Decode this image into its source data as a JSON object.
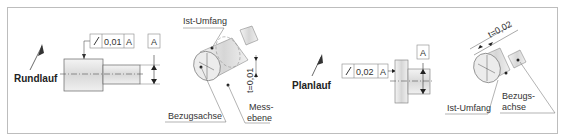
{
  "left": {
    "title": "Rundlauf",
    "tolerance_frame": {
      "symbol": "runout-arrow",
      "value": "0,01",
      "datum": "A"
    },
    "datum_box": "A",
    "labels": {
      "actual_circumference": "Ist-Umfang",
      "reference_axis": "Bezugsachse",
      "measurement_plane_1": "Mess-",
      "measurement_plane_2": "ebene",
      "tolerance_zone": "t=0,01"
    }
  },
  "right": {
    "title": "Planlauf",
    "tolerance_frame": {
      "symbol": "runout-arrow",
      "value": "0,02",
      "datum": "A"
    },
    "datum_box": "A",
    "labels": {
      "actual_circumference": "Ist-Umfang",
      "reference_axis_1": "Bezugs-",
      "reference_axis_2": "achse",
      "tolerance_zone": "t=0,02"
    }
  },
  "colors": {
    "border": "#bdbdbd",
    "line": "#333333",
    "part_fill": "#e4e4e4"
  }
}
